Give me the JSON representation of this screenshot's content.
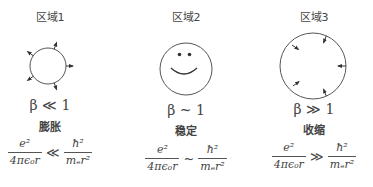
{
  "regions": [
    {
      "title": "区域1",
      "beta": "β ≪ 1",
      "state": "膨胀",
      "formula": {
        "lhs_num": "e²",
        "lhs_den": "4πϵ₀r",
        "relation": "≪",
        "rhs_num": "ħ²",
        "rhs_den": "mₑr²"
      },
      "figure": "circle-with-outward-arrows"
    },
    {
      "title": "区域2",
      "beta": "β ~ 1",
      "state": "稳定",
      "formula": {
        "lhs_num": "e²",
        "lhs_den": "4πϵ₀r",
        "relation": "~",
        "rhs_num": "ħ²",
        "rhs_den": "mₑr²"
      },
      "figure": "smiley-face-circle"
    },
    {
      "title": "区域3",
      "beta": "β ≫ 1",
      "state": "收缩",
      "formula": {
        "lhs_num": "e²",
        "lhs_den": "4πϵ₀r",
        "relation": "≫",
        "rhs_num": "ħ²",
        "rhs_den": "mₑr²"
      },
      "figure": "circle-with-inward-arrows"
    }
  ]
}
